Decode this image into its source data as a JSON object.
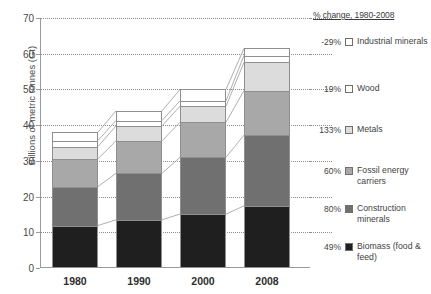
{
  "chart_data": {
    "type": "bar",
    "stacked": true,
    "title": "",
    "xlabel": "",
    "ylabel": "Billions of metric tonnes (Gt)",
    "categories": [
      "1980",
      "1990",
      "2000",
      "2008"
    ],
    "ylim": [
      0,
      70
    ],
    "yticks": [
      0,
      10,
      20,
      30,
      40,
      50,
      60,
      70
    ],
    "grid": true,
    "legend_position": "right",
    "legend_title": "% change, 1980-2008",
    "series": [
      {
        "name": "Biomass (food & feed)",
        "pct_change": "49%",
        "color": "#1f1f1f",
        "values": [
          11.9,
          13.5,
          15.1,
          17.4
        ]
      },
      {
        "name": "Construction minerals",
        "pct_change": "80%",
        "color": "#707070",
        "values": [
          10.9,
          13.0,
          15.9,
          19.8
        ]
      },
      {
        "name": "Fossil energy carriers",
        "pct_change": "60%",
        "color": "#a8a8a8",
        "values": [
          7.8,
          9.1,
          9.8,
          12.5
        ]
      },
      {
        "name": "Metals",
        "pct_change": "133%",
        "color": "#dcdcdc",
        "values": [
          3.4,
          4.2,
          4.5,
          7.9
        ]
      },
      {
        "name": "Wood",
        "pct_change": "19%",
        "color": "#ffffff",
        "values": [
          1.7,
          1.5,
          1.5,
          1.9
        ]
      },
      {
        "name": "Industrial minerals",
        "pct_change": "-29%",
        "color": "#ffffff",
        "values": [
          2.3,
          2.7,
          3.2,
          2.0
        ]
      }
    ],
    "totals": [
      38.0,
      44.0,
      50.0,
      61.5
    ]
  },
  "axis": {
    "y_tick_labels": [
      "0",
      "10",
      "20",
      "30",
      "40",
      "50",
      "60",
      "70"
    ],
    "x_tick_labels": [
      "1980",
      "1990",
      "2000",
      "2008"
    ],
    "y_title": "Billions of metric tonnes (Gt)"
  },
  "legend": {
    "title": "% change, 1980-2008",
    "items": [
      {
        "pct": "-29%",
        "label": "Industrial minerals",
        "color": "#ffffff"
      },
      {
        "pct": "19%",
        "label": "Wood",
        "color": "#ffffff"
      },
      {
        "pct": "133%",
        "label": "Metals",
        "color": "#dcdcdc"
      },
      {
        "pct": "60%",
        "label": "Fossil energy carriers",
        "color": "#a8a8a8"
      },
      {
        "pct": "80%",
        "label": "Construction minerals",
        "color": "#707070"
      },
      {
        "pct": "49%",
        "label": "Biomass (food & feed)",
        "color": "#1f1f1f"
      }
    ]
  }
}
